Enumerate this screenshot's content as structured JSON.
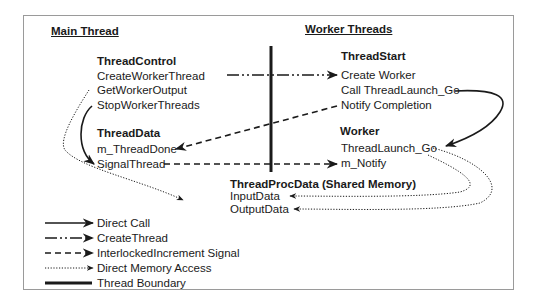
{
  "headers": {
    "main_thread": "Main Thread",
    "worker_threads": "Worker Threads"
  },
  "thread_control": {
    "title": "ThreadControl",
    "items": [
      "CreateWorkerThread",
      "GetWorkerOutput",
      "StopWorkerThreads"
    ]
  },
  "thread_data": {
    "title": "ThreadData",
    "items": [
      "m_ThreadDone",
      "SignalThread"
    ]
  },
  "thread_start": {
    "title": "ThreadStart",
    "items": [
      "Create Worker",
      "Call ThreadLaunch_Go",
      "Notify Completion"
    ]
  },
  "worker": {
    "title": "Worker",
    "items": [
      "ThreadLaunch_Go",
      "m_Notify"
    ]
  },
  "shared": {
    "title": "ThreadProcData (Shared Memory)",
    "items": [
      "InputData",
      "OutputData"
    ]
  },
  "legend": [
    {
      "style": "solid-arrow",
      "label": "Direct Call"
    },
    {
      "style": "dash-dot-dot-arrow",
      "label": "CreateThread"
    },
    {
      "style": "dashed-arrow",
      "label": "InterlockedIncrement Signal"
    },
    {
      "style": "dotted-arrow",
      "label": "Direct Memory Access"
    },
    {
      "style": "thick-line",
      "label": "Thread Boundary"
    }
  ],
  "colors": {
    "ink": "#1a1a1a",
    "frame": "#9a9a9a",
    "background": "#ffffff"
  }
}
